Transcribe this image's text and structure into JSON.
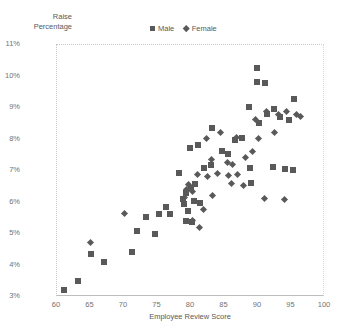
{
  "chart_data": {
    "type": "scatter",
    "title": "",
    "xlabel": "Employee Review Score",
    "ylabel": "Raise Percentage",
    "ylabel_lines": "Raise\nPercentage",
    "xlim": [
      60,
      100
    ],
    "ylim": [
      3,
      11
    ],
    "xticks": [
      60,
      65,
      70,
      75,
      80,
      85,
      90,
      95,
      100
    ],
    "xtick_labels": [
      "60",
      "65",
      "70",
      "75",
      "80",
      "85",
      "90",
      "95",
      "100"
    ],
    "yticks": [
      3,
      4,
      5,
      6,
      7,
      8,
      9,
      10,
      11
    ],
    "ytick_labels": [
      "3%",
      "4%",
      "5%",
      "6%",
      "7%",
      "8%",
      "9%",
      "10%",
      "11%"
    ],
    "grid": false,
    "legend_position": "top-center",
    "marker_color": "#595959",
    "axis_color": "#bdbdbd",
    "series": [
      {
        "name": "Male",
        "marker": "square",
        "points": [
          [
            61.0,
            3.22
          ],
          [
            63.2,
            3.52
          ],
          [
            65.1,
            4.38
          ],
          [
            67.0,
            4.12
          ],
          [
            71.2,
            4.42
          ],
          [
            73.3,
            5.55
          ],
          [
            72.0,
            5.08
          ],
          [
            75.2,
            5.62
          ],
          [
            76.2,
            5.85
          ],
          [
            76.9,
            5.62
          ],
          [
            74.6,
            5.0
          ],
          [
            78.8,
            6.12
          ],
          [
            79.2,
            6.3
          ],
          [
            79.0,
            5.95
          ],
          [
            79.5,
            5.72
          ],
          [
            80.4,
            6.05
          ],
          [
            80.0,
            6.45
          ],
          [
            80.6,
            6.58
          ],
          [
            81.3,
            5.98
          ],
          [
            79.3,
            5.4
          ],
          [
            80.1,
            5.38
          ],
          [
            79.8,
            7.72
          ],
          [
            81.0,
            7.82
          ],
          [
            78.2,
            6.95
          ],
          [
            83.2,
            8.38
          ],
          [
            84.6,
            7.62
          ],
          [
            85.5,
            7.55
          ],
          [
            83.0,
            7.18
          ],
          [
            82.0,
            7.1
          ],
          [
            86.6,
            7.98
          ],
          [
            87.6,
            8.05
          ],
          [
            88.6,
            9.02
          ],
          [
            89.8,
            10.28
          ],
          [
            89.8,
            9.82
          ],
          [
            91.0,
            9.8
          ],
          [
            91.3,
            8.82
          ],
          [
            90.2,
            8.52
          ],
          [
            92.4,
            8.98
          ],
          [
            93.3,
            8.7
          ],
          [
            94.6,
            8.62
          ],
          [
            95.4,
            9.28
          ],
          [
            88.8,
            7.08
          ],
          [
            92.2,
            7.12
          ],
          [
            94.0,
            7.05
          ],
          [
            95.2,
            7.02
          ],
          [
            89.0,
            6.62
          ]
        ]
      },
      {
        "name": "Female",
        "marker": "diamond",
        "points": [
          [
            65.0,
            4.72
          ],
          [
            70.0,
            5.65
          ],
          [
            79.0,
            6.15
          ],
          [
            79.4,
            6.42
          ],
          [
            79.6,
            6.58
          ],
          [
            80.2,
            6.35
          ],
          [
            80.2,
            5.42
          ],
          [
            81.2,
            5.2
          ],
          [
            81.8,
            5.78
          ],
          [
            82.4,
            6.82
          ],
          [
            83.0,
            7.38
          ],
          [
            82.3,
            8.02
          ],
          [
            84.4,
            8.22
          ],
          [
            85.4,
            7.28
          ],
          [
            84.0,
            6.92
          ],
          [
            85.6,
            6.85
          ],
          [
            86.2,
            7.22
          ],
          [
            87.0,
            6.88
          ],
          [
            86.0,
            6.6
          ],
          [
            87.8,
            6.55
          ],
          [
            88.2,
            7.42
          ],
          [
            89.2,
            7.62
          ],
          [
            90.0,
            8.02
          ],
          [
            91.2,
            8.88
          ],
          [
            92.4,
            8.22
          ],
          [
            93.0,
            8.8
          ],
          [
            94.2,
            8.88
          ],
          [
            95.8,
            8.78
          ],
          [
            96.4,
            8.72
          ],
          [
            91.0,
            6.12
          ],
          [
            94.0,
            6.1
          ],
          [
            83.2,
            6.22
          ],
          [
            81.0,
            6.88
          ],
          [
            86.8,
            8.05
          ],
          [
            89.6,
            8.62
          ]
        ]
      }
    ]
  },
  "legend": {
    "items": [
      {
        "label": "Male",
        "marker": "square"
      },
      {
        "label": "Female",
        "marker": "diamond"
      }
    ]
  }
}
